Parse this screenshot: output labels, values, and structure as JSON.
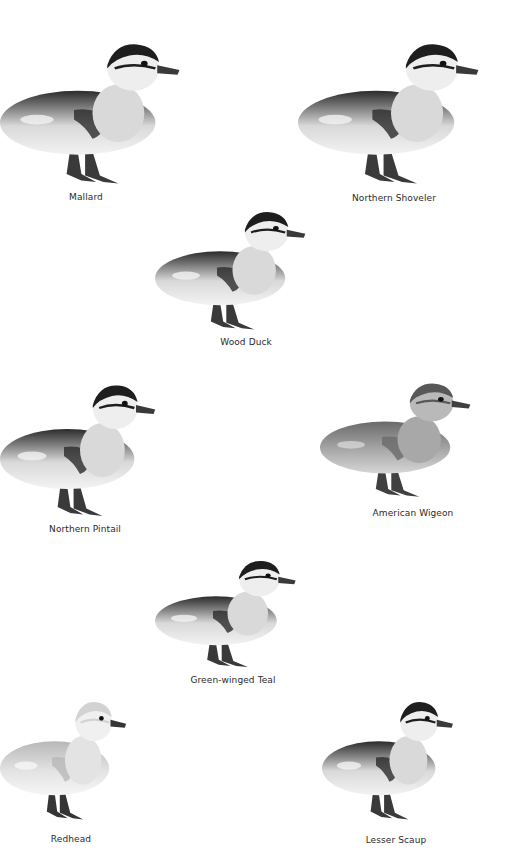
{
  "page": {
    "background": "#ffffff"
  },
  "ducklings": [
    {
      "name": "Mallard",
      "tone": "dark",
      "x": 0,
      "y": 30,
      "w": 185,
      "h": 160,
      "label_x": 86,
      "label_y": 192,
      "facing": "right"
    },
    {
      "name": "Northern Shoveler",
      "tone": "dark",
      "x": 298,
      "y": 30,
      "w": 186,
      "h": 160,
      "label_x": 394,
      "label_y": 193,
      "facing": "right"
    },
    {
      "name": "Wood Duck",
      "tone": "dark",
      "x": 155,
      "y": 200,
      "w": 155,
      "h": 135,
      "label_x": 246,
      "label_y": 337,
      "facing": "right"
    },
    {
      "name": "Northern Pintail",
      "tone": "dark",
      "x": 0,
      "y": 372,
      "w": 160,
      "h": 150,
      "label_x": 85,
      "label_y": 524,
      "facing": "right"
    },
    {
      "name": "American Wigeon",
      "tone": "medium",
      "x": 320,
      "y": 372,
      "w": 155,
      "h": 130,
      "label_x": 413,
      "label_y": 508,
      "facing": "right"
    },
    {
      "name": "Green-winged Teal",
      "tone": "dark",
      "x": 155,
      "y": 550,
      "w": 145,
      "h": 122,
      "label_x": 233,
      "label_y": 675,
      "facing": "right"
    },
    {
      "name": "Redhead",
      "tone": "light",
      "x": 0,
      "y": 690,
      "w": 130,
      "h": 135,
      "label_x": 71,
      "label_y": 834,
      "facing": "right"
    },
    {
      "name": "Lesser Scaup",
      "tone": "dark",
      "x": 322,
      "y": 690,
      "w": 135,
      "h": 135,
      "label_x": 396,
      "label_y": 835,
      "facing": "right"
    }
  ],
  "tones": {
    "dark": {
      "back": "#2b2b2b",
      "body": "#d9d9d9",
      "belly": "#f3f3f3",
      "cap": "#1e1e1e",
      "face": "#eeeeee",
      "leg": "#3a3a3a"
    },
    "medium": {
      "back": "#6a6a6a",
      "body": "#a8a8a8",
      "belly": "#d6d6d6",
      "cap": "#585858",
      "face": "#b9b9b9",
      "leg": "#404040"
    },
    "light": {
      "back": "#b8b8b8",
      "body": "#e3e3e3",
      "belly": "#f6f6f6",
      "cap": "#d2d2d2",
      "face": "#f0f0f0",
      "leg": "#353535"
    }
  }
}
